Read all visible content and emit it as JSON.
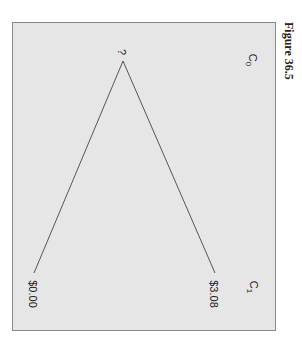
{
  "figure": {
    "title": "Figure 36.5",
    "orientation": "rotated 90 degrees clockwise",
    "headers": {
      "t0": "C",
      "t0_sub": "0",
      "t1": "C",
      "t1_sub": "1"
    },
    "root": {
      "label": "?"
    },
    "branches": [
      {
        "name": "up",
        "label": "$3.08"
      },
      {
        "name": "down",
        "label": "$0.00"
      }
    ]
  }
}
